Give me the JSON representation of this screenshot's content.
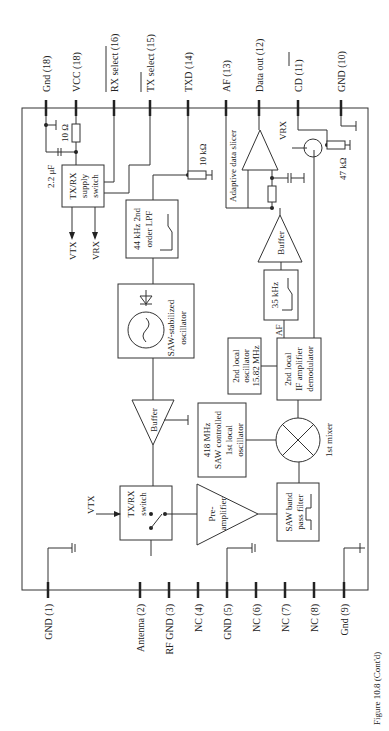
{
  "caption": "Figure 10.8   (Cont'd)",
  "pins_top": [
    {
      "label": "Gnd (18)"
    },
    {
      "label": "VCC (18)"
    },
    {
      "label": "RX select (16)",
      "overline": true
    },
    {
      "label": "TX select (15)",
      "overline": true
    },
    {
      "label": "TXD (14)"
    },
    {
      "label": "AF (13)"
    },
    {
      "label": "Data out (12)"
    },
    {
      "label": "CD (11)",
      "overline": true
    },
    {
      "label": "GND (10)"
    }
  ],
  "pins_bottom": [
    {
      "label": "GND (1)"
    },
    {
      "label": "Antenna (2)"
    },
    {
      "label": "RF GND (3)"
    },
    {
      "label": "NC (4)"
    },
    {
      "label": "GND (5)"
    },
    {
      "label": "NC (6)"
    },
    {
      "label": "NC (7)"
    },
    {
      "label": "NC (8)"
    },
    {
      "label": "Gnd (9)"
    }
  ],
  "blocks": {
    "supply_switch": {
      "line1": "TX/RX",
      "line2": "supply",
      "line3": "switch"
    },
    "lpf": {
      "line1": "44 kHz 2nd",
      "line2": "order LPF"
    },
    "saw_osc": {
      "line1": "SAW-stabilized",
      "line2": "oscillator"
    },
    "buffer_tx": {
      "label": "Buffer"
    },
    "txrx_switch": {
      "line1": "TX/RX",
      "line2": "switch"
    },
    "bpf_433": {
      "line1": "433 MHz",
      "line2": "band",
      "line3": "pass filter"
    },
    "preamp": {
      "line1": "Pre-",
      "line2": "amplifier"
    },
    "lo1": {
      "line1": "418 MHz",
      "line2": "SAW controlled",
      "line3": "1st local",
      "line4": "oscillator"
    },
    "saw_bpf": {
      "line1": "SAW band",
      "line2": "pass filter"
    },
    "mixer": {
      "label": "1st mixer"
    },
    "lo2": {
      "line1": "2nd local",
      "line2": "oscillator",
      "line3": "15.82 MHz"
    },
    "if_amp": {
      "line1": "2nd local",
      "line2": "IF amplifier",
      "line3": "demodulator"
    },
    "filter_35k": {
      "label": "35 kHz"
    },
    "buffer_rx": {
      "label": "Buffer"
    },
    "slicer": {
      "label": "Adaptive data slicer"
    }
  },
  "components": {
    "r_10ohm": "10 Ω",
    "c_2u2": "2.2 μF",
    "r_10k": "10 kΩ",
    "r_47k": "47 kΩ",
    "vtx": "VTX",
    "vrx": "VRX",
    "vtx_in": "VTX",
    "vrx_tr": "VRX",
    "af_label": "AF"
  }
}
